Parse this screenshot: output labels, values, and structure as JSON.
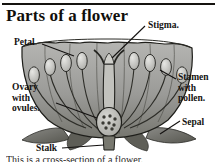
{
  "page": {
    "title": "Parts of a flower",
    "caption": "This is a cross-section of a flower."
  },
  "colors": {
    "ink": "#141210",
    "rule": "#15130f",
    "petal_light": "#b9b9b6",
    "petal_mid": "#8e8e8b",
    "petal_dark": "#6a6a67",
    "leaf": "#6f6f6c",
    "paper": "#ffffff"
  },
  "labels": [
    {
      "id": "stigma",
      "text": "Stigma."
    },
    {
      "id": "petal",
      "text": "Petal"
    },
    {
      "id": "ovary",
      "text": "Ovary with ovules."
    },
    {
      "id": "stamen",
      "text": "Stamen with pollen."
    },
    {
      "id": "sepal",
      "text": "Sepal"
    },
    {
      "id": "stalk",
      "text": "Stalk"
    }
  ],
  "diagram": {
    "type": "botanical-cross-section",
    "subject": "flower",
    "parts": [
      "petal",
      "stigma",
      "style",
      "ovary",
      "ovules",
      "stamen",
      "anther",
      "filament",
      "sepal",
      "stalk"
    ]
  }
}
